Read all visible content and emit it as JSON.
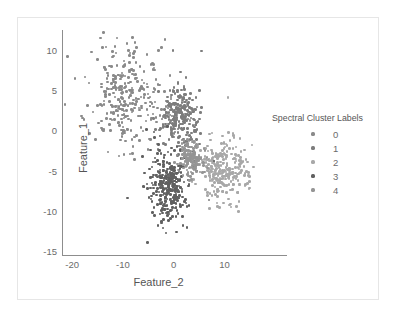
{
  "chart_data": {
    "type": "scatter",
    "title": "",
    "xlabel": "Feature_2",
    "ylabel": "Feature_1",
    "xlim": [
      -22,
      16
    ],
    "ylim": [
      -15.5,
      12.5
    ],
    "xticks": [
      "-20",
      "-10",
      "0",
      "10"
    ],
    "xtick_values": [
      -20,
      -10,
      0,
      10
    ],
    "yticks": [
      "10",
      "5",
      "0",
      "-5",
      "-10",
      "-15"
    ],
    "ytick_values": [
      10,
      5,
      0,
      -5,
      -10,
      -15
    ],
    "grid": false,
    "legend": {
      "title": "Spectral Cluster Labels",
      "position": "right",
      "entries": [
        {
          "label": "0",
          "color": "#8a8a8a"
        },
        {
          "label": "1",
          "color": "#7d7d7d"
        },
        {
          "label": "2",
          "color": "#a8a8a8"
        },
        {
          "label": "3",
          "color": "#606060"
        },
        {
          "label": "4",
          "color": "#959595"
        }
      ]
    },
    "series": [
      {
        "name": "0",
        "color": "#8a8a8a",
        "center": [
          -9.0,
          4.2
        ],
        "n": 300,
        "spread": [
          3.4,
          3.2
        ]
      },
      {
        "name": "1",
        "color": "#7d7d7d",
        "center": [
          1.2,
          2.0
        ],
        "n": 260,
        "spread": [
          1.9,
          1.9
        ]
      },
      {
        "name": "2",
        "color": "#a8a8a8",
        "center": [
          10.0,
          -5.0
        ],
        "n": 280,
        "spread": [
          2.4,
          1.9
        ]
      },
      {
        "name": "3",
        "color": "#606060",
        "center": [
          -1.2,
          -6.6
        ],
        "n": 330,
        "spread": [
          1.9,
          2.0
        ]
      },
      {
        "name": "4",
        "color": "#959595",
        "center": [
          3.4,
          -3.2
        ],
        "n": 150,
        "spread": [
          1.3,
          1.2
        ]
      }
    ]
  }
}
